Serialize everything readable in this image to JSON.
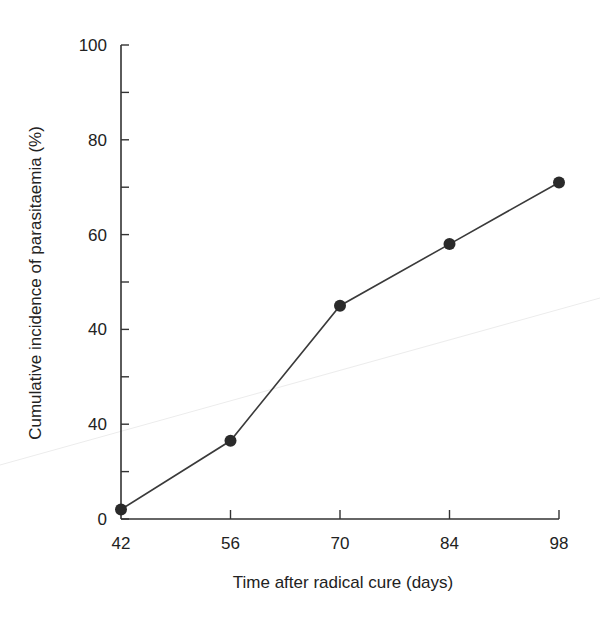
{
  "chart_data": {
    "type": "line",
    "title": "",
    "xlabel": "Time after radical cure (days)",
    "ylabel": "Cumulative incidence of parasitaemia (%)",
    "x": [
      42,
      56,
      70,
      84,
      98
    ],
    "series": [
      {
        "name": "Cumulative incidence",
        "values": [
          2,
          16.5,
          45,
          58,
          71
        ]
      }
    ],
    "x_ticks": [
      42,
      56,
      70,
      84,
      98
    ],
    "x_tick_labels": [
      "42",
      "56",
      "70",
      "84",
      "98"
    ],
    "y_ticks": [
      0,
      10,
      20,
      30,
      40,
      50,
      60,
      70,
      80,
      90,
      100
    ],
    "y_tick_labels": [
      {
        "value": 100,
        "label": "100"
      },
      {
        "value": 80,
        "label": "80"
      },
      {
        "value": 60,
        "label": "60"
      },
      {
        "value": 40,
        "label": "40"
      },
      {
        "value": 20,
        "label": "40"
      },
      {
        "value": 0,
        "label": "0"
      }
    ],
    "xlim": [
      42,
      98
    ],
    "ylim": [
      0,
      100
    ],
    "grid": false,
    "legend": "none",
    "marker": "filled-circle",
    "colors": {
      "line": "#3a3a3a",
      "marker": "#2a2a2a",
      "axis": "#333333"
    }
  }
}
